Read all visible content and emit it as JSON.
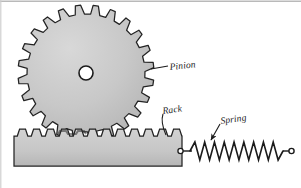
{
  "figure": {
    "background_color": "#ffffff",
    "line_color": "#1b1b1b",
    "fill_color": "#c9c9c9",
    "hub_fill": "#ffffff",
    "frame_color": "#b9b9b9"
  },
  "labels": {
    "pinion": "Pinion",
    "rack": "Rack",
    "spring": "Spring"
  },
  "pinion": {
    "name": "pinion-gear",
    "teeth_count": 24,
    "center_x": 86,
    "center_y": 73,
    "outer_radius": 68,
    "root_radius": 59,
    "hub_radius": 7
  },
  "rack": {
    "name": "rack-bar",
    "teeth_count": 12,
    "left": 14,
    "right": 182,
    "top": 136,
    "bottom": 166,
    "tooth_height": 7
  },
  "spring": {
    "name": "return-spring",
    "coils": 9,
    "left_x": 190,
    "right_x": 283,
    "center_y": 151,
    "amplitude": 9,
    "anchor_left_x": 181,
    "anchor_right_x": 290
  }
}
